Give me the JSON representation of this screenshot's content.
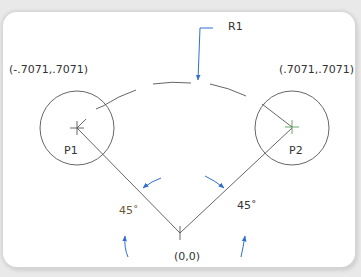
{
  "diagram": {
    "labels": {
      "r1": "R1",
      "p1_coord": "(-.7071,.7071)",
      "p2_coord": "(.7071,.7071)",
      "p1": "P1",
      "p2": "P2",
      "angle_left": "45˚",
      "angle_right": "45˚",
      "origin": "(0,0)"
    },
    "colors": {
      "line": "#555555",
      "dimension_arrow": "#2f6fd0",
      "background": "#ffffff",
      "frame_bg": "#e9e9e9"
    },
    "geometry": {
      "origin": [
        180,
        233
      ],
      "p1_center": [
        77,
        128
      ],
      "p2_center": [
        292,
        128
      ],
      "circle_radius": 37,
      "arc_radius": 150
    }
  }
}
